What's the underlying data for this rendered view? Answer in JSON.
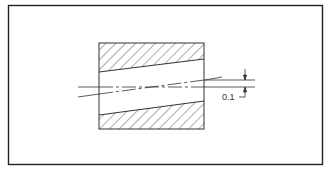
{
  "diagram": {
    "type": "engineering-drawing",
    "colors": {
      "line": "#333333",
      "frame": "#222222",
      "background": "#ffffff"
    },
    "frame": {
      "x": 8,
      "y": 5,
      "width": 315,
      "height": 160
    },
    "part": {
      "x": 99,
      "y": 43,
      "width": 105,
      "height": 86,
      "hatch": "section-hatch-45deg"
    },
    "bore": {
      "top_edge": {
        "x1": 99,
        "y1": 72,
        "x2": 204,
        "y2": 59
      },
      "bottom_edge": {
        "x1": 99,
        "y1": 115,
        "x2": 204,
        "y2": 101
      }
    },
    "axes": {
      "reference_axis": {
        "x1": 78,
        "y1": 87,
        "x2": 255,
        "y2": 87
      },
      "tilted_axis": {
        "x1": 78,
        "y1": 97,
        "x2": 222,
        "y2": 77
      }
    },
    "dimension": {
      "value": "0.1",
      "upper_line_y": 80,
      "lower_line_y": 87,
      "arrow_x": 245
    }
  }
}
